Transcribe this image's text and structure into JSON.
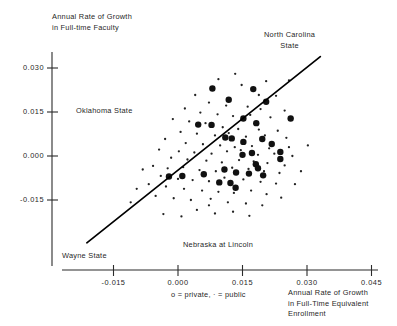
{
  "chart_data": {
    "type": "scatter",
    "title": "",
    "ylabel": "Annual Rate of Growth\nin Full-time Faculty",
    "xlabel": "Annual Rate of Growth\nin Full-Time Equivalent\nEnrollment",
    "legend": "o = private, · = public",
    "legend_position": "below-x-axis-left",
    "grid": false,
    "xlim": [
      -0.0235,
      0.0475
    ],
    "ylim": [
      -0.0235,
      0.0345
    ],
    "xticks": [
      -0.015,
      0.0,
      0.015,
      0.03,
      0.045
    ],
    "xtick_labels": [
      "-0.015",
      "0.000",
      "0.015",
      "0.030",
      "0.045"
    ],
    "yticks": [
      -0.015,
      0.0,
      0.015,
      0.03
    ],
    "ytick_labels": [
      "-0.015",
      "0.000",
      "0.015",
      "0.030"
    ],
    "annotations": [
      {
        "text": "North Carolina\nState",
        "x": 0.0318,
        "y": 0.0322
      },
      {
        "text": "Oklahoma State",
        "x": -0.0075,
        "y": 0.0155
      },
      {
        "text": "Nebraska at Lincoln",
        "x": 0.0012,
        "y": -0.0295
      },
      {
        "text": "Wayne State",
        "x": -0.0205,
        "y": -0.0333
      }
    ],
    "trend_line": {
      "label": "least-squares fit",
      "x_start": -0.0212,
      "y_start": -0.0296,
      "x_end": 0.0331,
      "y_end": 0.0339,
      "color": "#000000"
    },
    "series": [
      {
        "name": "private",
        "marker": "o",
        "marker_size": 3.2,
        "color": "#111111",
        "points": [
          [
            0.008,
            0.023
          ],
          [
            0.0175,
            0.0228
          ],
          [
            0.0118,
            0.0192
          ],
          [
            0.0205,
            0.0185
          ],
          [
            0.0047,
            0.0107
          ],
          [
            0.0078,
            0.0106
          ],
          [
            0.0182,
            0.0112
          ],
          [
            0.0152,
            0.0128
          ],
          [
            0.011,
            0.0063
          ],
          [
            0.0125,
            0.006
          ],
          [
            0.0152,
            0.0048
          ],
          [
            0.0196,
            0.0058
          ],
          [
            0.0218,
            0.0041
          ],
          [
            0.0238,
            0.0014
          ],
          [
            0.0238,
            -0.001
          ],
          [
            0.0172,
            0.001
          ],
          [
            0.015,
            0.0004
          ],
          [
            0.0181,
            -0.0028
          ],
          [
            0.0186,
            -0.0042
          ],
          [
            0.0165,
            -0.006
          ],
          [
            0.0198,
            -0.0066
          ],
          [
            0.0135,
            -0.0056
          ],
          [
            0.0108,
            -0.0046
          ],
          [
            0.006,
            -0.0062
          ],
          [
            0.001,
            -0.0068
          ],
          [
            -0.0021,
            -0.007
          ],
          [
            0.0096,
            -0.009
          ],
          [
            0.0122,
            -0.0092
          ],
          [
            0.0134,
            -0.0108
          ],
          [
            0.0262,
            0.0128
          ]
        ]
      },
      {
        "name": "public",
        "marker": ".",
        "marker_size": 1.15,
        "color": "#222222",
        "points": [
          [
            0.0133,
            0.028
          ],
          [
            0.0205,
            0.0255
          ],
          [
            0.0258,
            0.0258
          ],
          [
            0.0094,
            0.0262
          ],
          [
            0.0148,
            0.0242
          ],
          [
            0.0228,
            0.0205
          ],
          [
            0.004,
            0.0208
          ],
          [
            0.0072,
            0.0182
          ],
          [
            0.0112,
            0.0172
          ],
          [
            0.0162,
            0.0168
          ],
          [
            0.0192,
            0.016
          ],
          [
            0.0248,
            0.0155
          ],
          [
            0.0016,
            0.0162
          ],
          [
            0.0052,
            0.0148
          ],
          [
            0.0092,
            0.0142
          ],
          [
            0.0128,
            0.0136
          ],
          [
            0.0168,
            0.014
          ],
          [
            0.0215,
            0.0132
          ],
          [
            -0.0012,
            0.0126
          ],
          [
            0.0026,
            0.0118
          ],
          [
            0.0064,
            0.0112
          ],
          [
            0.0104,
            0.0098
          ],
          [
            0.014,
            0.0092
          ],
          [
            0.0188,
            0.009
          ],
          [
            0.0232,
            0.0086
          ],
          [
            0.0006,
            0.0082
          ],
          [
            0.0044,
            0.0076
          ],
          [
            0.0086,
            0.007
          ],
          [
            0.0118,
            0.0078
          ],
          [
            0.0158,
            0.0066
          ],
          [
            0.0202,
            0.007
          ],
          [
            0.0252,
            0.0062
          ],
          [
            -0.003,
            0.0058
          ],
          [
            0.0018,
            0.0044
          ],
          [
            0.0058,
            0.004
          ],
          [
            0.0098,
            0.0036
          ],
          [
            0.0132,
            0.003
          ],
          [
            0.0172,
            0.0034
          ],
          [
            0.0212,
            0.0026
          ],
          [
            0.0258,
            0.003
          ],
          [
            -0.0044,
            0.0022
          ],
          [
            0.0002,
            0.0016
          ],
          [
            0.0038,
            0.0012
          ],
          [
            0.0078,
            0.0008
          ],
          [
            0.0114,
            0.0016
          ],
          [
            0.0146,
            0.002
          ],
          [
            0.0186,
            0.0004
          ],
          [
            0.0224,
            0.0008
          ],
          [
            0.0266,
            0.0
          ],
          [
            -0.0016,
            -0.0006
          ],
          [
            0.0022,
            -0.0012
          ],
          [
            0.0066,
            -0.0016
          ],
          [
            0.0102,
            -0.0022
          ],
          [
            0.0142,
            -0.0014
          ],
          [
            0.0176,
            -0.0018
          ],
          [
            0.0208,
            -0.0024
          ],
          [
            0.0248,
            -0.0032
          ],
          [
            -0.0058,
            -0.0034
          ],
          [
            -0.0024,
            -0.0042
          ],
          [
            0.0012,
            -0.0038
          ],
          [
            0.005,
            -0.0048
          ],
          [
            0.0088,
            -0.0052
          ],
          [
            0.0126,
            -0.004
          ],
          [
            0.0164,
            -0.0044
          ],
          [
            0.02,
            -0.0052
          ],
          [
            0.0236,
            -0.0058
          ],
          [
            -0.004,
            -0.0068
          ],
          [
            0.0,
            -0.0078
          ],
          [
            0.0034,
            -0.0082
          ],
          [
            0.0072,
            -0.0086
          ],
          [
            0.0108,
            -0.0074
          ],
          [
            0.0152,
            -0.008
          ],
          [
            0.0192,
            -0.0088
          ],
          [
            0.0228,
            -0.0094
          ],
          [
            -0.0068,
            -0.0096
          ],
          [
            -0.0028,
            -0.0104
          ],
          [
            0.0014,
            -0.0112
          ],
          [
            0.0056,
            -0.0118
          ],
          [
            0.0094,
            -0.0122
          ],
          [
            0.013,
            -0.0126
          ],
          [
            0.017,
            -0.0118
          ],
          [
            0.0206,
            -0.013
          ],
          [
            -0.0052,
            -0.0136
          ],
          [
            -0.001,
            -0.0144
          ],
          [
            0.003,
            -0.015
          ],
          [
            0.0076,
            -0.0146
          ],
          [
            0.0116,
            -0.0158
          ],
          [
            0.0158,
            -0.0162
          ],
          [
            0.0196,
            -0.0168
          ],
          [
            -0.0082,
            -0.0046
          ],
          [
            -0.0096,
            -0.0112
          ],
          [
            -0.011,
            -0.0158
          ],
          [
            0.0044,
            -0.0184
          ],
          [
            0.0086,
            -0.0196
          ],
          [
            0.0128,
            -0.019
          ],
          [
            0.0166,
            -0.0204
          ],
          [
            0.0008,
            -0.0206
          ],
          [
            -0.0034,
            -0.0198
          ],
          [
            0.024,
            -0.0142
          ],
          [
            0.0272,
            -0.0096
          ],
          [
            0.0286,
            -0.0052
          ],
          [
            0.0302,
            0.0036
          ],
          [
            0.0188,
            0.0208
          ],
          [
            0.0072,
            -0.0168
          ]
        ]
      }
    ]
  },
  "axes": {
    "y_title_line1": "Annual Rate of Growth",
    "y_title_line2": "in Full-time Faculty",
    "x_title_line1": "Annual Rate of Growth",
    "x_title_line2": "in Full-Time Equivalent",
    "x_title_line3": "Enrollment"
  },
  "legend": {
    "text": "o = private, · = public"
  },
  "annotations": {
    "nc_line1": "North Carolina",
    "nc_line2": "State",
    "oklahoma": "Oklahoma State",
    "nebraska": "Nebraska at Lincoln",
    "wayne": "Wayne State"
  }
}
